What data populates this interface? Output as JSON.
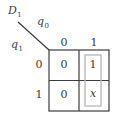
{
  "diagram": {
    "type": "karnaugh-map",
    "output": {
      "name": "D",
      "subscript": "1"
    },
    "column_var": {
      "name": "q",
      "subscript": "0"
    },
    "row_var": {
      "name": "q",
      "subscript": "1"
    },
    "column_headers": [
      "0",
      "1"
    ],
    "row_headers": [
      "0",
      "1"
    ],
    "cells": [
      [
        "0",
        "1"
      ],
      [
        "0",
        "x"
      ]
    ],
    "grouping": {
      "description": "loop around column q0=1 (cells 1 and x)",
      "color": "#b5b5b5"
    },
    "colors": {
      "grid_line": "#3c3c3c",
      "text": "#3a3a3a",
      "background": "#ffffff"
    }
  }
}
